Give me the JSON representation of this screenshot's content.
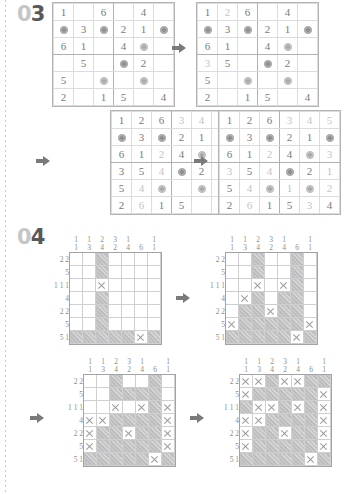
{
  "page": {
    "sections": [
      {
        "number_prefix": "0",
        "number_digit": "3"
      },
      {
        "number_prefix": "0",
        "number_digit": "4"
      }
    ],
    "arrow_icon": "arrow-right-icon"
  },
  "sudoku": {
    "size": 6,
    "blob_glyph": "shaded-circle",
    "puzzles": [
      {
        "name": "sudoku-step-1",
        "rows": [
          [
            "1",
            "",
            "6",
            "",
            "4",
            ""
          ],
          [
            "@",
            "3",
            "@",
            "2",
            "1",
            "@"
          ],
          [
            "6",
            "1",
            "",
            "4",
            "@",
            ""
          ],
          [
            "",
            "5",
            "",
            "@",
            "2",
            ""
          ],
          [
            "5",
            "",
            "@",
            "",
            "@",
            ""
          ],
          [
            "2",
            "",
            "1",
            "5",
            "",
            "4"
          ]
        ],
        "faint": []
      },
      {
        "name": "sudoku-step-2",
        "rows": [
          [
            "1",
            "2",
            "6",
            "",
            "4",
            ""
          ],
          [
            "@",
            "3",
            "@",
            "2",
            "1",
            "@"
          ],
          [
            "6",
            "1",
            "",
            "4",
            "@",
            ""
          ],
          [
            "3",
            "5",
            "",
            "@",
            "2",
            ""
          ],
          [
            "5",
            "",
            "@",
            "",
            "@",
            ""
          ],
          [
            "2",
            "",
            "1",
            "5",
            "",
            "4"
          ]
        ],
        "faint": [
          [
            0,
            1
          ],
          [
            3,
            0
          ]
        ]
      },
      {
        "name": "sudoku-step-3",
        "rows": [
          [
            "1",
            "2",
            "6",
            "3",
            "4",
            "5"
          ],
          [
            "@",
            "3",
            "@",
            "2",
            "1",
            "@"
          ],
          [
            "6",
            "1",
            "2",
            "4",
            "@",
            ""
          ],
          [
            "3",
            "5",
            "4",
            "@",
            "2",
            ""
          ],
          [
            "5",
            "4",
            "@",
            "",
            "@",
            ""
          ],
          [
            "2",
            "6",
            "1",
            "5",
            "",
            "4"
          ]
        ],
        "faint": [
          [
            0,
            3
          ],
          [
            0,
            4
          ],
          [
            0,
            5
          ],
          [
            2,
            2
          ],
          [
            3,
            2
          ],
          [
            4,
            1
          ],
          [
            5,
            1
          ]
        ]
      },
      {
        "name": "sudoku-step-4",
        "rows": [
          [
            "1",
            "2",
            "6",
            "3",
            "4",
            "5"
          ],
          [
            "@",
            "3",
            "@",
            "2",
            "1",
            "@"
          ],
          [
            "6",
            "1",
            "2",
            "4",
            "@",
            "3"
          ],
          [
            "3",
            "5",
            "4",
            "@",
            "2",
            "1"
          ],
          [
            "5",
            "4",
            "@",
            "1",
            "@",
            "2"
          ],
          [
            "2",
            "6",
            "1",
            "5",
            "3",
            "4"
          ]
        ],
        "faint": [
          [
            0,
            3
          ],
          [
            0,
            4
          ],
          [
            0,
            5
          ],
          [
            2,
            2
          ],
          [
            2,
            5
          ],
          [
            3,
            0
          ],
          [
            3,
            2
          ],
          [
            3,
            5
          ],
          [
            4,
            1
          ],
          [
            4,
            3
          ],
          [
            4,
            5
          ],
          [
            5,
            1
          ],
          [
            5,
            4
          ]
        ]
      }
    ]
  },
  "nonogram": {
    "cols": 7,
    "rows": 7,
    "col_clues": [
      [
        "1",
        "1"
      ],
      [
        "1",
        "3"
      ],
      [
        "2",
        "4"
      ],
      [
        "3",
        "2"
      ],
      [
        "1",
        "4"
      ],
      [
        "6"
      ],
      [
        "1",
        "1"
      ]
    ],
    "row_clues": [
      [
        "2",
        "2"
      ],
      [
        "5"
      ],
      [
        "1",
        "1",
        "1"
      ],
      [
        "4"
      ],
      [
        "2",
        "2"
      ],
      [
        "5"
      ],
      [
        "5",
        "1"
      ]
    ],
    "legend": {
      "filled": "filled-cell",
      "crossed": "crossed-cell",
      "empty": "empty-cell"
    },
    "steps": [
      {
        "name": "nonogram-step-1",
        "grid": [
          [
            ".",
            ".",
            "#",
            ".",
            ".",
            ".",
            "."
          ],
          [
            ".",
            ".",
            "#",
            ".",
            ".",
            ".",
            "."
          ],
          [
            ".",
            ".",
            "x",
            ".",
            ".",
            ".",
            "."
          ],
          [
            ".",
            ".",
            "#",
            ".",
            ".",
            ".",
            "."
          ],
          [
            ".",
            ".",
            "#",
            ".",
            ".",
            ".",
            "."
          ],
          [
            ".",
            ".",
            "#",
            ".",
            ".",
            ".",
            "."
          ],
          [
            "#",
            "#",
            "#",
            "#",
            "#",
            "x",
            "#"
          ]
        ]
      },
      {
        "name": "nonogram-step-2",
        "grid": [
          [
            ".",
            ".",
            "#",
            ".",
            ".",
            "#",
            "."
          ],
          [
            ".",
            ".",
            "#",
            ".",
            ".",
            "#",
            "."
          ],
          [
            ".",
            ".",
            "x",
            ".",
            "x",
            "#",
            "."
          ],
          [
            ".",
            "x",
            "#",
            ".",
            "#",
            "#",
            "."
          ],
          [
            ".",
            "#",
            "#",
            "x",
            "#",
            "#",
            "."
          ],
          [
            "x",
            "#",
            "#",
            "#",
            "#",
            "#",
            "x"
          ],
          [
            "#",
            "#",
            "#",
            "#",
            "#",
            "x",
            "#"
          ]
        ]
      },
      {
        "name": "nonogram-step-3",
        "grid": [
          [
            ".",
            ".",
            "#",
            ".",
            ".",
            "#",
            "."
          ],
          [
            ".",
            ".",
            "#",
            "#",
            "#",
            "#",
            "."
          ],
          [
            ".",
            ".",
            "x",
            ".",
            "x",
            "#",
            "x"
          ],
          [
            "x",
            "x",
            "#",
            "#",
            "#",
            "#",
            "x"
          ],
          [
            "x",
            "#",
            "#",
            "x",
            "#",
            "#",
            "x"
          ],
          [
            "x",
            "#",
            "#",
            "#",
            "#",
            "#",
            "x"
          ],
          [
            "#",
            "#",
            "#",
            "#",
            "#",
            "x",
            "#"
          ]
        ]
      },
      {
        "name": "nonogram-step-4",
        "grid": [
          [
            "x",
            "x",
            "#",
            "x",
            "x",
            "#",
            "#"
          ],
          [
            "x",
            "#",
            "#",
            "#",
            "#",
            "#",
            "x"
          ],
          [
            "#",
            "x",
            "x",
            "#",
            "x",
            "#",
            "x"
          ],
          [
            "x",
            "x",
            "#",
            "#",
            "#",
            "#",
            "x"
          ],
          [
            "x",
            "#",
            "#",
            "x",
            "#",
            "#",
            "x"
          ],
          [
            "x",
            "#",
            "#",
            "#",
            "#",
            "#",
            "x"
          ],
          [
            "#",
            "#",
            "#",
            "#",
            "#",
            "x",
            "#"
          ]
        ]
      }
    ]
  }
}
